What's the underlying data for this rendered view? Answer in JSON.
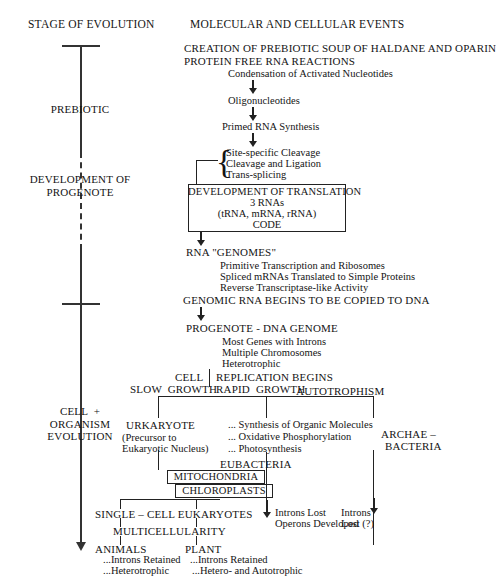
{
  "headers": {
    "left": "STAGE OF EVOLUTION",
    "right": "MOLECULAR AND CELLULAR EVENTS"
  },
  "timeline": {
    "stages": [
      {
        "label": "PREBIOTIC"
      },
      {
        "label": "DEVELOPMENT OF\nPROGENOTE"
      },
      {
        "label": "CELL  +\nORGANISM\nEVOLUTION"
      }
    ]
  },
  "events": {
    "creation_soup": "CREATION OF PREBIOTIC SOUP OF HALDANE AND OPARIN",
    "protein_free": "PROTEIN FREE RNA REACTIONS",
    "condensation": "Condensation of Activated Nucleotides",
    "oligonucleotides": "Oligonucleotides",
    "primed_rna": "Primed RNA Synthesis",
    "brace_items": [
      "Site-specific Cleavage",
      "Cleavage and Ligation",
      "Trans-splicing"
    ],
    "translation_box": {
      "line1": "DEVELOPMENT OF TRANSLATION",
      "line2": "3 RNAs",
      "line3": "(tRNA, mRNA, rRNA)",
      "line4": "CODE"
    },
    "rna_genomes": "RNA \"GENOMES\"",
    "rna_genomes_items": [
      "Primitive Transcription and Ribosomes",
      "Spliced mRNAs Translated to Simple Proteins",
      "Reverse Transcriptase-like Activity"
    ],
    "genomic_rna_copied": "GENOMIC RNA BEGINS TO BE COPIED TO DNA",
    "progenote": "PROGENOTE - DNA GENOME",
    "progenote_items": [
      "Most Genes with Introns",
      "Multiple Chromosomes",
      "Heterotrophic"
    ],
    "cell_label": "CELL",
    "replication_begins": "REPLICATION BEGINS",
    "slow_growth": "SLOW  GROWTH",
    "rapid_growth": "RAPID  GROWTH",
    "autotrophism": "AUTOTROPHISM",
    "urkaryote": "URKARYOTE",
    "urkaryote_sub1": "(Precursor to",
    "urkaryote_sub2": "Eukaryotic Nucleus)",
    "middle_items": [
      "... Synthesis of Organic Molecules",
      "... Oxidative Phosphorylation",
      "... Photosynthesis"
    ],
    "archae_line1": "ARCHAE –",
    "archae_line2": "BACTERIA",
    "eubacteria": "EUBACTERIA",
    "mitochondria": "MITOCHONDRIA",
    "chloroplasts": "CHLOROPLASTS",
    "single_cell_eukaryotes": "SINGLE – CELL EUKARYOTES",
    "introns_lost": "Introns Lost",
    "operons_developed": "Operons Developed",
    "introns_right_line1": "Introns",
    "introns_right_line2": "Lost (?)",
    "multicellularity": "MULTICELLULARITY",
    "animals": "ANIMALS",
    "plant": "PLANT",
    "animals_items": [
      "...Introns Retained",
      "...Heterotrophic"
    ],
    "plant_items": [
      "...Introns Retained",
      "...Hetero- and Autotrophic"
    ]
  }
}
